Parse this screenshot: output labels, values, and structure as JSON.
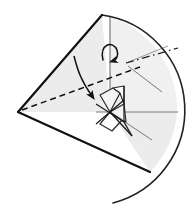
{
  "figure": {
    "type": "geometric-line-diagram",
    "width": 189,
    "height": 217,
    "background_color": "#ffffff",
    "alt_text": "Line drawing of a cone seen from the side with an apex at the left, a large circular-arc base at the right, a dashed hidden edge, a dash-dot rotation axis, a curved rotation arrow, a straight fold arrow, and a small folded polyhedral flap at the centre."
  },
  "colors": {
    "stroke_dark": "#111111",
    "stroke_mid": "#3a3a3a",
    "stroke_light": "#8c8c8c",
    "fill_shade": "#ececec",
    "fill_shade_light": "#f3f3f3",
    "fill_white": "#ffffff",
    "background": "#ffffff"
  },
  "geometry": {
    "apex": {
      "x": 18,
      "y": 112,
      "label": "apex"
    },
    "top_vertex": {
      "x": 102,
      "y": 15,
      "label": "upper rim point"
    },
    "bottom_vertex": {
      "x": 150,
      "y": 172,
      "label": "lower rim point"
    },
    "center": {
      "x": 110,
      "y": 112,
      "label": "centre / axis origin"
    },
    "arc_start": {
      "x": 102,
      "y": 15
    },
    "arc_end": {
      "x": 113,
      "y": 203
    },
    "arc_radius": 96,
    "axis_line_start": {
      "x": 126,
      "y": 63
    },
    "axis_line_end": {
      "x": 177,
      "y": 48
    },
    "horizontal_line_start": {
      "x": 110,
      "y": 112
    },
    "horizontal_line_end": {
      "x": 178,
      "y": 112
    },
    "vertical_line_start": {
      "x": 110,
      "y": 18
    },
    "vertical_line_end": {
      "x": 110,
      "y": 112
    }
  },
  "elements": {
    "cone_upper_face": {
      "name": "cone-upper-face",
      "description": "Shaded triangular upper face of the cone from apex to the upper rim",
      "fill": "#ececec",
      "stroke": "#111111"
    },
    "cone_lower_face": {
      "name": "cone-lower-face",
      "description": "White lower triangular face of the cone from apex to the lower rim",
      "fill": "#ffffff",
      "stroke": "#111111"
    },
    "base_arc": {
      "name": "cone-base-arc",
      "description": "Large circular arc forming the visible base rim of the cone",
      "stroke": "#222222"
    },
    "hidden_edge": {
      "name": "hidden-edge-dashed",
      "description": "Dashed line from apex to centre showing the hidden edge behind the cone",
      "stroke": "#111111",
      "dash_pattern": "5,3"
    },
    "rotation_axis": {
      "name": "rotation-axis-dashdot",
      "description": "Dash-dot line indicating the axis of rotation",
      "stroke": "#222222",
      "dash_pattern": "7,3,1.5,3"
    },
    "rotation_arrow": {
      "name": "rotation-arrow-curved",
      "description": "Small curved arrow near the top indicating rotational direction about the axis",
      "stroke": "#111111"
    },
    "fold_arrow": {
      "name": "fold-arrow-straight",
      "description": "Curved-shaft arrow with solid head pointing down-right toward the centre, indicating a fold motion",
      "stroke": "#111111"
    },
    "flap_upper": {
      "name": "folded-flap-upper",
      "description": "Small quadrilateral flap above the centre, lightly shaded",
      "fill": "#f3f3f3",
      "stroke": "#2a2a2a"
    },
    "flap_lower": {
      "name": "folded-flap-lower",
      "description": "Small quadrilateral flap below the centre",
      "fill": "#ffffff",
      "stroke": "#2a2a2a"
    },
    "sector_shade": {
      "name": "base-sector-shade",
      "description": "Shaded sector between the centre, lower rim point and the base arc",
      "fill": "#ececec",
      "stroke": "#8c8c8c"
    },
    "radial_guide_upper": {
      "name": "radial-guide-upper",
      "description": "Thin radial guide line from the axis region toward the base arc"
    },
    "radial_guide_lower": {
      "name": "radial-guide-lower",
      "description": "Thin radial guide line from the centre toward the lower base arc"
    }
  },
  "labels": {
    "visible_text": []
  }
}
